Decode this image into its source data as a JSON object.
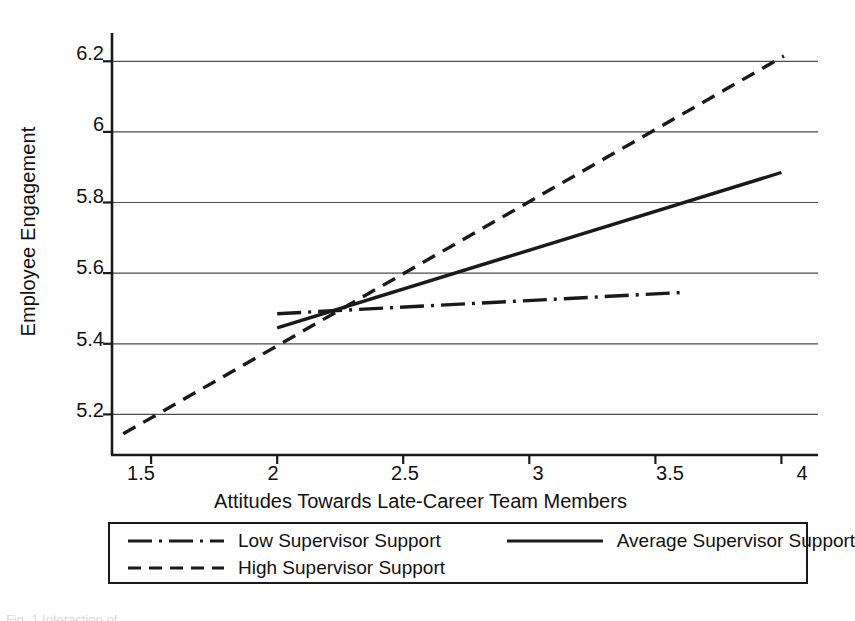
{
  "chart_data": {
    "type": "line",
    "title": "",
    "xlabel": "Attitudes Towards Late-Career Team Members",
    "ylabel": "Employee Engagement",
    "xlim": [
      1.345,
      4.145
    ],
    "ylim": [
      5.085,
      6.28
    ],
    "xticks": [
      "1.5",
      "2",
      "2.5",
      "3",
      "3.5",
      "4"
    ],
    "xtick_values": [
      1.5,
      2,
      2.5,
      3,
      3.5,
      4
    ],
    "yticks": [
      "5.2",
      "5.4",
      "5.6",
      "5.8",
      "6",
      "6.2"
    ],
    "ytick_values": [
      5.2,
      5.4,
      5.6,
      5.8,
      6.0,
      6.2
    ],
    "grid": "horizontal",
    "legend_position": "bottom",
    "series": [
      {
        "name": "Low Supervisor Support",
        "style": "dash-dot",
        "x": [
          2.0,
          3.6
        ],
        "y": [
          5.485,
          5.545
        ]
      },
      {
        "name": "Average Supervisor Support",
        "style": "solid",
        "x": [
          2.0,
          4.0
        ],
        "y": [
          5.445,
          5.885
        ]
      },
      {
        "name": "High Supervisor Support",
        "style": "dashed",
        "x": [
          1.39,
          4.01
        ],
        "y": [
          5.145,
          6.215
        ]
      }
    ]
  },
  "axes": {
    "y_title": "Employee Engagement",
    "x_title": "Attitudes Towards Late-Career Team Members",
    "y_tick_labels": [
      "6.2",
      "6",
      "5.8",
      "5.6",
      "5.4",
      "5.2"
    ],
    "x_tick_labels": [
      "1.5",
      "2",
      "2.5",
      "3",
      "3.5",
      "4"
    ]
  },
  "legend": {
    "items": [
      {
        "label": "Low Supervisor Support",
        "style": "dash-dot"
      },
      {
        "label": "Average Supervisor Support",
        "style": "solid"
      },
      {
        "label": "High Supervisor Support",
        "style": "dashed"
      }
    ]
  },
  "colors": {
    "line": "#1a1a1a",
    "grid": "#4d4d4d",
    "axis": "#1a1a1a",
    "background": "#ffffff",
    "text": "#111111"
  },
  "caption_sliver": "Fig. 1 Interaction of"
}
